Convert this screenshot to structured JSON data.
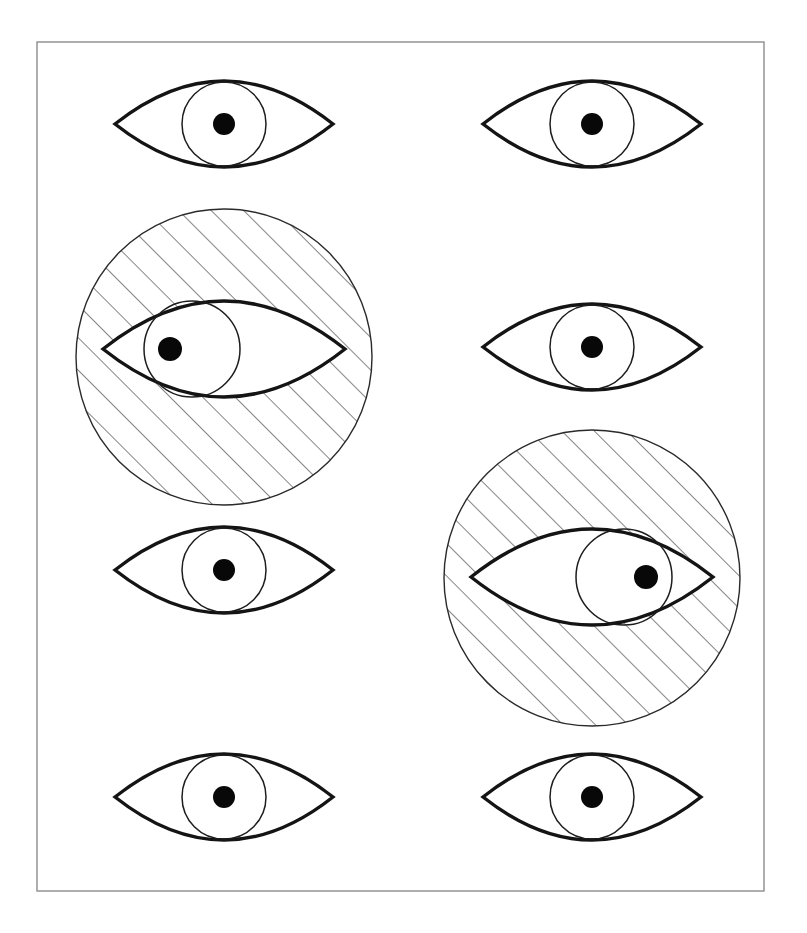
{
  "figure": {
    "canvas": {
      "width": 807,
      "height": 933,
      "background": "#ffffff"
    },
    "frame": {
      "name": "outer-frame",
      "x": 37,
      "y": 42,
      "width": 727,
      "height": 849,
      "stroke_color": "#8c8c8c",
      "stroke_width": 1.4,
      "fill": "none"
    },
    "style": {
      "eye_outline_color": "#141414",
      "eye_outline_width": 3.4,
      "iris_color": "#1d1d1d",
      "iris_width": 1.5,
      "pupil_color": "#080808",
      "halo_color": "#2a2a2a",
      "halo_width": 1.4,
      "hatch_color": "#2a2a2a",
      "hatch_width": 1.15,
      "hatch_angle_degrees": 45,
      "hatch_spacing": 23
    },
    "columns": [
      {
        "name": "left-column",
        "center_x": 224
      },
      {
        "name": "right-column",
        "center_x": 592
      }
    ],
    "rows": [
      {
        "name": "row-1",
        "center_y": 124
      },
      {
        "name": "row-2",
        "center_y": 347
      },
      {
        "name": "row-3",
        "center_y": 572
      },
      {
        "name": "row-4",
        "center_y": 797
      }
    ],
    "eyes": [
      {
        "id": "eye-r1c1",
        "label": "Eye row 1 column 1",
        "row": 1,
        "column": 1,
        "center_x": 224,
        "center_y": 124,
        "variant": "plain",
        "gaze": "center",
        "outline_rx": 109,
        "outline_ry": 43,
        "iris_radius": 42,
        "iris_offset_x": 0,
        "pupil_radius": 11,
        "pupil_offset_x": 0,
        "halo": null
      },
      {
        "id": "eye-r1c2",
        "label": "Eye row 1 column 2",
        "row": 1,
        "column": 2,
        "center_x": 592,
        "center_y": 124,
        "variant": "plain",
        "gaze": "center",
        "outline_rx": 109,
        "outline_ry": 43,
        "iris_radius": 42,
        "iris_offset_x": 0,
        "pupil_radius": 11,
        "pupil_offset_x": 0,
        "halo": null
      },
      {
        "id": "eye-r2c1",
        "label": "Hatched eye row 2 column 1",
        "row": 2,
        "column": 1,
        "center_x": 224,
        "center_y": 349,
        "variant": "hatched",
        "gaze": "left",
        "outline_rx": 121,
        "outline_ry": 48,
        "iris_radius": 48,
        "iris_offset_x": -32,
        "pupil_radius": 12,
        "pupil_offset_x": -54,
        "halo": {
          "rx": 148,
          "ry": 148,
          "center_x": 224,
          "center_y": 357
        }
      },
      {
        "id": "eye-r2c2",
        "label": "Eye row 2 column 2",
        "row": 2,
        "column": 2,
        "center_x": 592,
        "center_y": 347,
        "variant": "plain",
        "gaze": "center",
        "outline_rx": 109,
        "outline_ry": 43,
        "iris_radius": 42,
        "iris_offset_x": 0,
        "pupil_radius": 11,
        "pupil_offset_x": 0,
        "halo": null
      },
      {
        "id": "eye-r3c1",
        "label": "Eye row 3 column 1",
        "row": 3,
        "column": 1,
        "center_x": 224,
        "center_y": 570,
        "variant": "plain",
        "gaze": "center",
        "outline_rx": 109,
        "outline_ry": 43,
        "iris_radius": 42,
        "iris_offset_x": 0,
        "pupil_radius": 11,
        "pupil_offset_x": 0,
        "halo": null
      },
      {
        "id": "eye-r3c2",
        "label": "Hatched eye row 3 column 2",
        "row": 3,
        "column": 2,
        "center_x": 592,
        "center_y": 577,
        "variant": "hatched",
        "gaze": "right",
        "outline_rx": 121,
        "outline_ry": 48,
        "iris_radius": 48,
        "iris_offset_x": 32,
        "pupil_radius": 12,
        "pupil_offset_x": 54,
        "halo": {
          "rx": 148,
          "ry": 148,
          "center_x": 592,
          "center_y": 578
        }
      },
      {
        "id": "eye-r4c1",
        "label": "Eye row 4 column 1",
        "row": 4,
        "column": 1,
        "center_x": 224,
        "center_y": 797,
        "variant": "plain",
        "gaze": "center",
        "outline_rx": 109,
        "outline_ry": 43,
        "iris_radius": 42,
        "iris_offset_x": 0,
        "pupil_radius": 11,
        "pupil_offset_x": 0,
        "halo": null
      },
      {
        "id": "eye-r4c2",
        "label": "Eye row 4 column 2",
        "row": 4,
        "column": 2,
        "center_x": 592,
        "center_y": 797,
        "variant": "plain",
        "gaze": "center",
        "outline_rx": 109,
        "outline_ry": 43,
        "iris_radius": 42,
        "iris_offset_x": 0,
        "pupil_radius": 11,
        "pupil_offset_x": 0,
        "halo": null
      }
    ]
  }
}
